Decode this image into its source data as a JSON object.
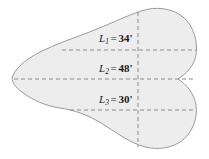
{
  "figure": {
    "kind": "geometry-diagram",
    "shape": {
      "fill_color": "#ededed",
      "stroke_color": "#9a9a9a",
      "stroke_width": 1,
      "left_tip_x": 12,
      "right_max_x": 196,
      "top_y": 10,
      "bottom_y": 148,
      "notch_x": 178,
      "notch_y": 79
    },
    "guides": {
      "dash_color": "#8c8c8c",
      "dash_pattern": "4,3",
      "vertical_guide_x": 138,
      "vertical_guide_top": 12,
      "vertical_guide_bottom": 147
    },
    "measurements": [
      {
        "id": "L1",
        "variable": "L",
        "subscript": "1",
        "equals": "=",
        "value": "34",
        "unit_mark": "'",
        "full_text": "L1 = 34'",
        "line_y": 50,
        "line_x_start": 62,
        "line_x_end": 196
      },
      {
        "id": "L2",
        "variable": "L",
        "subscript": "2",
        "equals": "=",
        "value": "48",
        "unit_mark": "'",
        "full_text": "L2 = 48'",
        "line_y": 79,
        "line_x_start": 14,
        "line_x_end": 196
      },
      {
        "id": "L3",
        "variable": "L",
        "subscript": "3",
        "equals": "=",
        "value": "30",
        "unit_mark": "'",
        "full_text": "L3 = 30'",
        "line_y": 110,
        "line_x_start": 70,
        "line_x_end": 196
      }
    ]
  }
}
